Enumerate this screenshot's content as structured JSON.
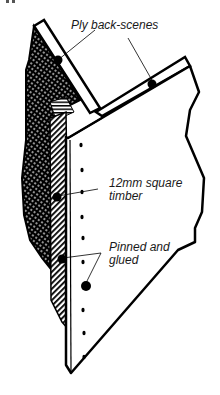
{
  "figure": {
    "colors": {
      "ink": "#000000",
      "paper": "#ffffff",
      "text": "#1a1a1a"
    }
  },
  "labels": {
    "ply": {
      "text": "Ply back-scenes"
    },
    "timber": {
      "line1": "12mm square",
      "line2": "timber"
    },
    "pinned": {
      "line1": "Pinned and",
      "line2": "glued"
    }
  }
}
